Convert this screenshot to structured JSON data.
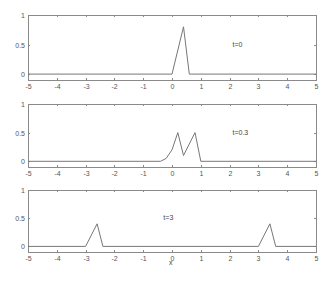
{
  "chart_data": [
    {
      "type": "line",
      "annotation": "t=0",
      "xlim": [
        -5,
        5
      ],
      "ylim": [
        -0.1,
        1
      ],
      "xticks": [
        -5,
        -4,
        -3,
        -2,
        -1,
        0,
        1,
        2,
        3,
        4,
        5
      ],
      "yticks": [
        0,
        0.5,
        1
      ],
      "ytick_labels": [
        "0",
        "0.5",
        "1"
      ],
      "x": [
        -5,
        0,
        0.4,
        0.6,
        5
      ],
      "y": [
        0,
        0,
        0.8,
        0,
        0
      ],
      "annotation_pos": [
        2.1,
        0.5
      ],
      "grid": false
    },
    {
      "type": "line",
      "annotation": "t=0.3",
      "xlim": [
        -5,
        5
      ],
      "ylim": [
        -0.1,
        1
      ],
      "xticks": [
        -5,
        -4,
        -3,
        -2,
        -1,
        0,
        1,
        2,
        3,
        4,
        5
      ],
      "yticks": [
        0,
        0.5,
        1
      ],
      "ytick_labels": [
        "0",
        "0.5",
        "1"
      ],
      "x": [
        -5,
        -0.4,
        -0.2,
        0,
        0.2,
        0.4,
        0.8,
        1.0,
        5
      ],
      "y": [
        0,
        0,
        0.05,
        0.2,
        0.5,
        0.1,
        0.5,
        0,
        0
      ],
      "annotation_pos": [
        2.1,
        0.5
      ],
      "grid": false
    },
    {
      "type": "line",
      "annotation": "t=3",
      "xlim": [
        -5,
        5
      ],
      "ylim": [
        -0.1,
        1
      ],
      "xticks": [
        -5,
        -4,
        -3,
        -2,
        -1,
        0,
        1,
        2,
        3,
        4,
        5
      ],
      "yticks": [
        0,
        0.5,
        1
      ],
      "ytick_labels": [
        "0",
        "0.5",
        "1"
      ],
      "x": [
        -5,
        -3,
        -2.6,
        -2.4,
        3,
        3.4,
        3.6,
        5
      ],
      "y": [
        0,
        0,
        0.4,
        0,
        0,
        0.4,
        0,
        0
      ],
      "annotation_pos": [
        -0.3,
        0.5
      ],
      "grid": false,
      "xlabel": "x"
    }
  ],
  "layout": {
    "panels": [
      {
        "left": 28,
        "right": 316,
        "top": 15,
        "bottom": 80
      },
      {
        "left": 28,
        "right": 316,
        "top": 104,
        "bottom": 167
      },
      {
        "left": 28,
        "right": 316,
        "top": 190,
        "bottom": 252
      }
    ]
  },
  "labels": {
    "xlabel": "x"
  }
}
